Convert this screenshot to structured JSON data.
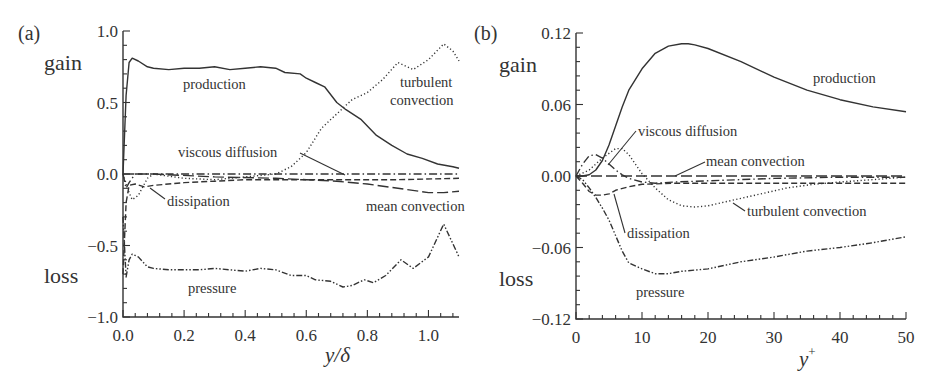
{
  "chart_data": [
    {
      "panel": "(a)",
      "type": "line",
      "xlabel": "y/δ",
      "ylabel_top": "gain",
      "ylabel_bottom": "loss",
      "xlim": [
        0.0,
        1.1
      ],
      "ylim": [
        -1.0,
        1.0
      ],
      "xticks": [
        "0.0",
        "0.2",
        "0.4",
        "0.6",
        "0.8",
        "1.0"
      ],
      "yticks": [
        "-1.0",
        "-0.5",
        "0.0",
        "0.5",
        "1.0"
      ],
      "grid": false,
      "series": [
        {
          "name": "production",
          "style": "solid",
          "x": [
            0.0,
            0.01,
            0.02,
            0.03,
            0.05,
            0.08,
            0.1,
            0.15,
            0.2,
            0.25,
            0.3,
            0.35,
            0.4,
            0.45,
            0.5,
            0.53,
            0.58,
            0.6,
            0.63,
            0.66,
            0.7,
            0.73,
            0.78,
            0.83,
            0.88,
            0.93,
            0.98,
            1.03,
            1.08,
            1.1
          ],
          "y": [
            0.0,
            0.55,
            0.78,
            0.81,
            0.79,
            0.75,
            0.74,
            0.73,
            0.74,
            0.74,
            0.75,
            0.73,
            0.74,
            0.75,
            0.74,
            0.71,
            0.7,
            0.67,
            0.64,
            0.61,
            0.5,
            0.45,
            0.38,
            0.27,
            0.2,
            0.14,
            0.11,
            0.07,
            0.05,
            0.04
          ]
        },
        {
          "name": "turbulent convection",
          "style": "dotted",
          "x": [
            0.0,
            0.02,
            0.03,
            0.05,
            0.08,
            0.1,
            0.2,
            0.3,
            0.4,
            0.5,
            0.55,
            0.6,
            0.65,
            0.7,
            0.75,
            0.8,
            0.85,
            0.9,
            0.95,
            1.0,
            1.05,
            1.08,
            1.1
          ],
          "y": [
            0.0,
            -0.13,
            -0.18,
            -0.15,
            -0.03,
            0.0,
            -0.03,
            -0.04,
            -0.02,
            0.0,
            0.05,
            0.15,
            0.32,
            0.42,
            0.52,
            0.57,
            0.66,
            0.78,
            0.73,
            0.8,
            0.91,
            0.86,
            0.79
          ]
        },
        {
          "name": "viscous diffusion",
          "style": "dash-dot",
          "x": [
            0.0,
            0.01,
            0.02,
            0.04,
            0.1,
            0.3,
            0.6,
            0.8,
            1.0,
            1.1
          ],
          "y": [
            0.0,
            -0.1,
            -0.06,
            0.0,
            0.0,
            0.0,
            0.0,
            0.0,
            0.0,
            0.0
          ]
        },
        {
          "name": "dissipation",
          "style": "dashed",
          "x": [
            0.0,
            0.01,
            0.02,
            0.04,
            0.07,
            0.1,
            0.2,
            0.3,
            0.4,
            0.5,
            0.7,
            0.9,
            1.1
          ],
          "y": [
            -0.7,
            -0.2,
            -0.08,
            -0.07,
            -0.09,
            -0.08,
            -0.06,
            -0.05,
            -0.04,
            -0.04,
            -0.04,
            -0.04,
            -0.03
          ]
        },
        {
          "name": "mean convection",
          "style": "long-dash",
          "x": [
            0.0,
            0.1,
            0.3,
            0.5,
            0.6,
            0.7,
            0.8,
            0.9,
            1.0,
            1.05,
            1.1
          ],
          "y": [
            0.0,
            0.0,
            -0.02,
            -0.03,
            -0.04,
            -0.05,
            -0.07,
            -0.1,
            -0.13,
            -0.13,
            -0.12
          ]
        },
        {
          "name": "pressure",
          "style": "dash-dot-dot",
          "x": [
            0.0,
            0.01,
            0.02,
            0.03,
            0.05,
            0.08,
            0.1,
            0.15,
            0.2,
            0.25,
            0.3,
            0.35,
            0.4,
            0.45,
            0.5,
            0.55,
            0.6,
            0.63,
            0.68,
            0.72,
            0.75,
            0.79,
            0.82,
            0.86,
            0.91,
            0.95,
            1.0,
            1.05,
            1.1
          ],
          "y": [
            -0.3,
            -0.72,
            -0.6,
            -0.56,
            -0.58,
            -0.65,
            -0.66,
            -0.67,
            -0.67,
            -0.67,
            -0.66,
            -0.67,
            -0.68,
            -0.66,
            -0.67,
            -0.71,
            -0.71,
            -0.74,
            -0.75,
            -0.79,
            -0.78,
            -0.74,
            -0.76,
            -0.71,
            -0.6,
            -0.66,
            -0.58,
            -0.35,
            -0.58
          ]
        }
      ],
      "annotations": [
        "production",
        "turbulent convection",
        "viscous diffusion",
        "dissipation",
        "mean convection",
        "pressure"
      ]
    },
    {
      "panel": "(b)",
      "type": "line",
      "xlabel": "y+",
      "ylabel_top": "gain",
      "ylabel_bottom": "loss",
      "xlim": [
        0,
        50
      ],
      "ylim": [
        -0.12,
        0.12
      ],
      "xticks": [
        "0",
        "10",
        "20",
        "30",
        "40",
        "50"
      ],
      "yticks": [
        "-0.12",
        "-0.06",
        "0.00",
        "0.06",
        "0.12"
      ],
      "grid": false,
      "series": [
        {
          "name": "production",
          "style": "solid",
          "x": [
            0,
            1,
            2,
            3,
            4,
            5,
            6,
            7,
            8,
            10,
            12,
            14,
            16,
            17,
            18,
            20,
            25,
            30,
            35,
            40,
            45,
            50
          ],
          "y": [
            0.0,
            0.0,
            0.001,
            0.005,
            0.013,
            0.026,
            0.042,
            0.058,
            0.072,
            0.09,
            0.103,
            0.109,
            0.111,
            0.111,
            0.11,
            0.107,
            0.096,
            0.083,
            0.072,
            0.064,
            0.058,
            0.054
          ]
        },
        {
          "name": "viscous diffusion",
          "style": "dash-dot",
          "x": [
            0,
            1,
            2,
            3,
            4,
            5,
            6,
            7,
            8,
            10,
            12,
            15,
            20,
            30,
            40,
            50
          ],
          "y": [
            0.0,
            0.01,
            0.017,
            0.018,
            0.015,
            0.01,
            0.005,
            0.001,
            -0.002,
            -0.005,
            -0.006,
            -0.005,
            -0.004,
            -0.002,
            -0.001,
            -0.001
          ]
        },
        {
          "name": "mean convection",
          "style": "long-dash",
          "x": [
            0,
            10,
            20,
            30,
            40,
            50
          ],
          "y": [
            0.0,
            0.0,
            0.0,
            0.0,
            0.0,
            0.0
          ]
        },
        {
          "name": "turbulent convection",
          "style": "dotted",
          "x": [
            0,
            2,
            4,
            6,
            7,
            8,
            9,
            10,
            12,
            14,
            16,
            18,
            20,
            24,
            28,
            32,
            36,
            40,
            45,
            50
          ],
          "y": [
            0.0,
            0.005,
            0.015,
            0.023,
            0.023,
            0.018,
            0.01,
            0.002,
            -0.01,
            -0.02,
            -0.025,
            -0.026,
            -0.025,
            -0.02,
            -0.015,
            -0.01,
            -0.007,
            -0.005,
            -0.003,
            -0.001
          ]
        },
        {
          "name": "dissipation",
          "style": "dashed",
          "x": [
            0,
            1,
            2,
            3,
            4,
            5,
            6,
            8,
            10,
            15,
            20,
            30,
            40,
            50
          ],
          "y": [
            0.0,
            -0.006,
            -0.013,
            -0.016,
            -0.016,
            -0.015,
            -0.012,
            -0.009,
            -0.007,
            -0.006,
            -0.006,
            -0.006,
            -0.006,
            -0.006
          ]
        },
        {
          "name": "pressure",
          "style": "dash-dot-dot",
          "x": [
            0,
            1,
            2,
            3,
            4,
            5,
            6,
            7,
            8,
            10,
            12,
            14,
            16,
            18,
            20,
            25,
            30,
            35,
            40,
            45,
            50
          ],
          "y": [
            0.0,
            -0.003,
            -0.01,
            -0.018,
            -0.027,
            -0.037,
            -0.05,
            -0.063,
            -0.073,
            -0.078,
            -0.082,
            -0.082,
            -0.08,
            -0.079,
            -0.078,
            -0.072,
            -0.068,
            -0.063,
            -0.06,
            -0.056,
            -0.051
          ]
        }
      ],
      "annotations": [
        "production",
        "viscous diffusion",
        "mean convection",
        "turbulent convection",
        "dissipation",
        "pressure"
      ]
    }
  ],
  "panels": {
    "a": {
      "label": "(a)",
      "gain": "gain",
      "loss": "loss",
      "xlabel_italic": "y/δ",
      "labels": {
        "production": "production",
        "turbulent": "turbulent",
        "convection": "convection",
        "viscous_diffusion": "viscous diffusion",
        "dissipation": "dissipation",
        "mean_convection": "mean convection",
        "pressure": "pressure"
      }
    },
    "b": {
      "label": "(b)",
      "gain": "gain",
      "loss": "loss",
      "xlabel_italic": "y",
      "xlabel_sup": "+",
      "labels": {
        "production": "production",
        "viscous_diffusion": "viscous diffusion",
        "mean_convection": "mean convection",
        "turbulent_convection": "turbulent convection",
        "dissipation": "dissipation",
        "pressure": "pressure"
      }
    }
  }
}
